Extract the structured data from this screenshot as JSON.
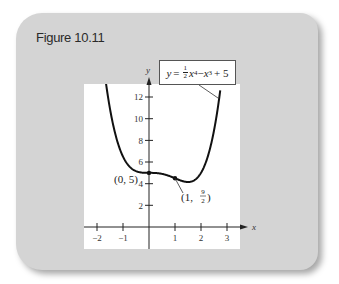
{
  "figure": {
    "title": "Figure 10.11",
    "equation_label": {
      "lhs": "y",
      "eq": "=",
      "frac_num": "1",
      "frac_den": "2",
      "term1": "x",
      "exp1": "4",
      "minus": "−",
      "term2": "x",
      "exp2": "3",
      "plus": "+ 5"
    },
    "annotations": {
      "point_a": "(0, 5)",
      "point_b_prefix": "(1,",
      "point_b_num": "9",
      "point_b_den": "2",
      "point_b_suffix": ")"
    }
  },
  "chart_data": {
    "type": "line",
    "title": "Figure 10.11",
    "function": "y = (1/2)x^4 - x^3 + 5",
    "xlabel": "x",
    "ylabel": "y",
    "xlim": [
      -2.5,
      3.5
    ],
    "ylim": [
      -2,
      13.2
    ],
    "x_ticks": [
      -2,
      -1,
      1,
      2,
      3
    ],
    "y_ticks": [
      2,
      4,
      6,
      8,
      10,
      12
    ],
    "x_tick_labels": [
      "−2",
      "−1",
      "1",
      "2",
      "3"
    ],
    "y_tick_labels": [
      "2",
      "4",
      "6",
      "8",
      "10",
      "12"
    ],
    "grid": false,
    "series": [
      {
        "name": "y = ½x⁴ − x³ + 5",
        "x": [
          -1.6,
          -1.5,
          -1.25,
          -1.0,
          -0.75,
          -0.5,
          -0.25,
          0,
          0.25,
          0.5,
          0.75,
          1.0,
          1.25,
          1.5,
          1.75,
          2.0,
          2.25,
          2.5,
          2.7
        ],
        "y": [
          13.37,
          11.91,
          9.15,
          6.5,
          6.58,
          5.16,
          5.02,
          5.0,
          4.98,
          4.91,
          4.74,
          4.5,
          4.27,
          4.16,
          4.33,
          5.0,
          6.42,
          8.91,
          11.89
        ]
      }
    ],
    "marked_points": [
      {
        "x": 0,
        "y": 5,
        "label": "(0, 5)"
      },
      {
        "x": 1,
        "y": 4.5,
        "label": "(1, 9/2)"
      }
    ]
  }
}
